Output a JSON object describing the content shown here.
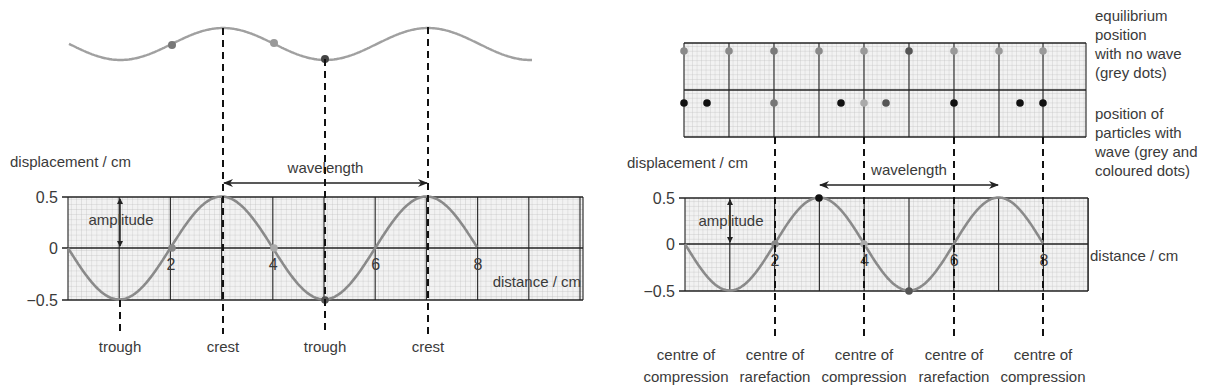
{
  "left": {
    "top_wave": {
      "x0": 69,
      "x1": 532,
      "y_center": 44,
      "amp": 16,
      "period_px": 205,
      "phase_crest_x": 223,
      "color": "#a0a0a0",
      "dots": [
        {
          "x": 172,
          "y": 45,
          "color": "#777777"
        },
        {
          "x": 274,
          "y": 43,
          "color": "#999999"
        },
        {
          "x": 325,
          "y": 59,
          "color": "#444444"
        }
      ]
    },
    "graph": {
      "x0": 68,
      "x1": 583,
      "y_top": 197,
      "y_zero": 248,
      "y_bot": 300,
      "px_per_cm": 51.2,
      "cm_max": 10,
      "y_axis_label": "displacement / cm",
      "x_axis_label": "distance / cm",
      "y_ticks": [
        {
          "label": "0.5",
          "y": 197
        },
        {
          "label": "0",
          "y": 248
        },
        {
          "label": "−0.5",
          "y": 300
        }
      ],
      "x_ticks": [
        {
          "label": "2",
          "cm": 2
        },
        {
          "label": "4",
          "cm": 4
        },
        {
          "label": "6",
          "cm": 6
        },
        {
          "label": "8",
          "cm": 8
        }
      ],
      "curve_cm_end": 8,
      "curve_color": "#8a8a8a",
      "amplitude_label": "amplitude",
      "amplitude_arrow_x": 120,
      "wavelength_label": "wavelength",
      "wavelength_arrow": {
        "x0": 223,
        "x1": 428,
        "y": 183
      },
      "zero_dots": [
        {
          "x": 172,
          "color": "#888888"
        },
        {
          "x": 274,
          "color": "#aaaaaa"
        }
      ],
      "point_dots": [
        {
          "x": 325,
          "y": 300,
          "color": "#555555"
        }
      ]
    },
    "markers": [
      {
        "x": 120,
        "label": "trough",
        "y_start": 300
      },
      {
        "x": 223,
        "label": "crest",
        "y_start": 28
      },
      {
        "x": 325,
        "label": "trough",
        "y_start": 59
      },
      {
        "x": 428,
        "label": "crest",
        "y_start": 27
      }
    ],
    "marker_label_y": 352
  },
  "right": {
    "particle_grid": {
      "x0": 684,
      "x1": 1086,
      "y_top": 43,
      "y_mid": 90,
      "y_bot": 137,
      "major_xs": [
        684,
        729,
        774,
        819,
        864,
        909,
        954,
        999,
        1043
      ],
      "equilibrium_dots": [
        {
          "x": 684,
          "color": "#8a8a8a"
        },
        {
          "x": 729,
          "color": "#8a8a8a"
        },
        {
          "x": 774,
          "color": "#7a7a7a"
        },
        {
          "x": 819,
          "color": "#8a8a8a"
        },
        {
          "x": 864,
          "color": "#9a9a9a"
        },
        {
          "x": 909,
          "color": "#555555"
        },
        {
          "x": 954,
          "color": "#9a9a9a"
        },
        {
          "x": 999,
          "color": "#9a9a9a"
        },
        {
          "x": 1043,
          "color": "#9a9a9a"
        }
      ],
      "wave_dots": [
        {
          "x": 684,
          "color": "#111111"
        },
        {
          "x": 707,
          "color": "#111111"
        },
        {
          "x": 774,
          "color": "#777777"
        },
        {
          "x": 841,
          "color": "#111111"
        },
        {
          "x": 864,
          "color": "#aaaaaa"
        },
        {
          "x": 886,
          "color": "#555555"
        },
        {
          "x": 954,
          "color": "#111111"
        },
        {
          "x": 1020,
          "color": "#111111"
        },
        {
          "x": 1043,
          "color": "#111111"
        }
      ],
      "eq_row_y": 51,
      "wave_row_y": 103
    },
    "graph": {
      "x0": 685,
      "x1": 1088,
      "y_top": 198,
      "y_zero": 244,
      "y_bot": 291,
      "px_per_cm": 44.8,
      "cm_max": 9,
      "y_axis_label": "displacement / cm",
      "x_axis_label": "distance / cm",
      "y_ticks": [
        {
          "label": "0.5",
          "y": 198
        },
        {
          "label": "0",
          "y": 244
        },
        {
          "label": "−0.5",
          "y": 291
        }
      ],
      "x_ticks": [
        {
          "label": "2",
          "cm": 2
        },
        {
          "label": "4",
          "cm": 4
        },
        {
          "label": "6",
          "cm": 6
        },
        {
          "label": "8",
          "cm": 8
        }
      ],
      "curve_cm_end": 8,
      "curve_color": "#8a8a8a",
      "amplitude_label": "amplitude",
      "amplitude_arrow_x": 730,
      "wavelength_label": "wavelength",
      "wavelength_arrow": {
        "x0": 819,
        "x1": 999,
        "y": 185
      },
      "zero_dots": [
        {
          "x": 775,
          "color": "#888888"
        },
        {
          "x": 864,
          "color": "#aaaaaa"
        }
      ],
      "point_dots": [
        {
          "x": 819,
          "y": 198,
          "color": "#111111"
        },
        {
          "x": 909,
          "y": 291,
          "color": "#555555"
        }
      ]
    },
    "markers": [
      {
        "x": 775,
        "line1": "centre of",
        "line2": "compression"
      },
      {
        "x": 864,
        "line1": "centre of",
        "line2": "rarefaction"
      },
      {
        "x": 954,
        "line1": "centre of",
        "line2": "compression"
      },
      {
        "x": 1043,
        "line1": "centre of",
        "line2": "rarefaction"
      }
    ],
    "bottom_labels": [
      {
        "x": 686,
        "line1": "centre of",
        "line2": "compression"
      },
      {
        "x": 775,
        "line1": "centre of",
        "line2": "rarefaction"
      },
      {
        "x": 864,
        "line1": "centre of",
        "line2": "compression"
      },
      {
        "x": 954,
        "line1": "centre of",
        "line2": "rarefaction"
      },
      {
        "x": 1043,
        "line1": "centre of",
        "line2": "compression"
      }
    ],
    "dashed_xs": [
      775,
      864,
      954,
      1043
    ],
    "dashed_y0": 137,
    "dashed_y1": 340,
    "notes": {
      "equilibrium": [
        "equilibrium",
        "position",
        "with no wave",
        "(grey dots)"
      ],
      "with_wave": [
        "position of",
        "particles with",
        "wave (grey and",
        "coloured dots)"
      ]
    }
  }
}
